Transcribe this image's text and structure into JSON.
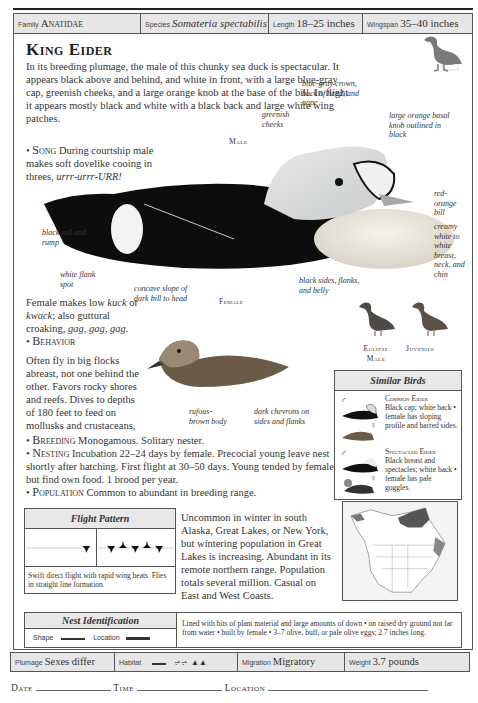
{
  "header": {
    "family_label": "Family",
    "family": "Anatidae",
    "species_label": "Species",
    "species": "Somateria spectabilis",
    "length_label": "Length",
    "length": "18–25 inches",
    "wingspan_label": "Wingspan",
    "wingspan": "35–40 inches"
  },
  "title": "King Eider",
  "intro": "In its breeding plumage, the male of this chunky sea duck is spectacular. It appears black above and behind, and white in front, with a large blue-gray cap, greenish cheeks, and a large orange knob at the base of the bill. In flight it appears mostly black and white with a black back and large white wing patches.",
  "song": {
    "label": "Song",
    "text": "During courtship male makes soft dovelike cooing in threes,",
    "call": "urrr-urrr-URR!"
  },
  "male": {
    "caption": "Male",
    "callouts": [
      "blue-gray crown, back of head, and nape",
      "greenish cheeks",
      "large orange basal knob outlined in black",
      "red-orange bill",
      "creamy white to white breast, neck, and chin",
      "black tail and rump",
      "white flank spot",
      "black sides, flanks, and belly"
    ]
  },
  "female": {
    "caption": "Female",
    "callouts": [
      "concave slope of dark bill to head",
      "rufous-brown body",
      "dark chevrons on sides and flanks"
    ],
    "text_pre": "Female makes low",
    "call1": "kuck",
    "or": "or",
    "call2": "kwack",
    "text_mid": "; also guttural croaking,",
    "call3": "gag, gag, gag."
  },
  "behavior": {
    "label": "Behavior",
    "text": "Often fly in big flocks abreast, not one behind the other. Favors rocky shores and reefs. Dives to depths of 180 feet to feed on mollusks and crustaceans, its primary food."
  },
  "variants": {
    "eclipse": "Eclipse Male",
    "juvenile": "Juvenile"
  },
  "breeding": {
    "label": "Breeding",
    "text": "Monogamous. Solitary nester."
  },
  "nesting": {
    "label": "Nesting",
    "text": "Incubation 22–24 days by female. Precocial young leave nest shortly after hatching. First flight at 30–50 days. Young tended by female but find own food. 1 brood per year."
  },
  "population": {
    "label": "Population",
    "text": "Common to abundant in breeding range.",
    "continued": "Uncommon in winter in south Alaska, Great Lakes, or New York, but wintering population in Great Lakes is increasing. Abundant in its remote northern range. Population totals several million. Casual on East and West Coasts."
  },
  "similar_birds": {
    "title": "Similar Birds",
    "items": [
      {
        "name": "Common Eider",
        "text": "Black cap; white back • female has sloping profile and barred sides."
      },
      {
        "name": "Spectacled Eider",
        "text": "Black breast and spectacles; white back • female has pale goggles."
      }
    ]
  },
  "flight_pattern": {
    "title": "Flight Pattern",
    "description": "Swift direct flight with rapid wing beats. Flies in straight line formation."
  },
  "nest_id": {
    "title": "Nest Identification",
    "shape_label": "Shape",
    "location_label": "Location",
    "description": "Lined with bits of plant material and large amounts of down • on raised dry ground not far from water • built by female • 3–7 olive, buff, or pale olive eggs; 2.7 inches long."
  },
  "footer": {
    "plumage_label": "Plumage",
    "plumage": "Sexes differ",
    "habitat_label": "Habitat",
    "migration_label": "Migration",
    "migration": "Migratory",
    "weight_label": "Weight",
    "weight": "3.7 pounds"
  },
  "log": {
    "date": "Date",
    "time": "Time",
    "location": "Location"
  }
}
